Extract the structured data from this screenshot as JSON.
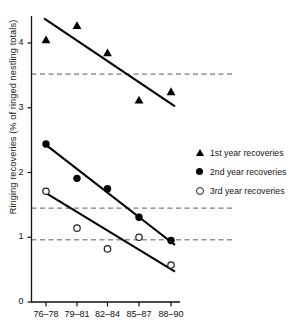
{
  "chart_data": {
    "type": "scatter",
    "title": "",
    "xlabel": "",
    "ylabel": "Ringing recoveries (% of ringed nestling totals)",
    "categories": [
      "76–78",
      "79–81",
      "82–84",
      "85–87",
      "88–90"
    ],
    "yticks": [
      "0",
      "1",
      "2",
      "3",
      "4"
    ],
    "ylim": [
      0,
      4.45
    ],
    "grid": false,
    "legend_position": "right",
    "series": [
      {
        "name": "1st year recoveries",
        "marker": "filled-triangle",
        "color": "#000000",
        "values": [
          4.05,
          4.27,
          3.85,
          3.12,
          3.25
        ],
        "trendline": {
          "y_start": 4.38,
          "y_end": 3.02
        }
      },
      {
        "name": "2nd year recoveries",
        "marker": "filled-circle",
        "color": "#000000",
        "values": [
          2.44,
          1.91,
          1.75,
          1.31,
          0.95
        ],
        "trendline": {
          "y_start": 2.45,
          "y_end": 0.88
        }
      },
      {
        "name": "3rd year recoveries",
        "marker": "open-circle",
        "color": "#222222",
        "values": [
          1.71,
          1.14,
          0.82,
          1.0,
          0.57
        ],
        "trendline": {
          "y_start": 1.7,
          "y_end": 0.47
        }
      }
    ],
    "reference_lines": [
      {
        "value": 3.52,
        "style": "dashed"
      },
      {
        "value": 1.45,
        "style": "dashed"
      },
      {
        "value": 0.96,
        "style": "dashed"
      }
    ]
  },
  "legend": {
    "items": [
      {
        "label": "1st year recoveries",
        "marker": "filled-triangle"
      },
      {
        "label": "2nd year recoveries",
        "marker": "filled-circle"
      },
      {
        "label": "3rd year recoveries",
        "marker": "open-circle"
      }
    ]
  }
}
